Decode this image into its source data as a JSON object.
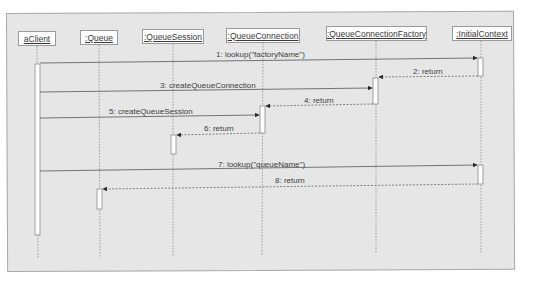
{
  "diagram": {
    "type": "UML sequence diagram",
    "lifelines": [
      {
        "id": "aClient",
        "label": "aClient",
        "x": 37
      },
      {
        "id": "queue",
        "label": ":Queue",
        "x": 99
      },
      {
        "id": "queueSession",
        "label": ":QueueSession",
        "x": 173
      },
      {
        "id": "queueConnection",
        "label": ":QueueConnection",
        "x": 263
      },
      {
        "id": "queueConnectionFactory",
        "label": ":QueueConnectionFactory",
        "x": 376
      },
      {
        "id": "initialContext",
        "label": ":InitialContext",
        "x": 481
      }
    ],
    "messages": [
      {
        "num": "1",
        "label": "1: lookup(\"factoryName\")",
        "from": "aClient",
        "to": "initialContext",
        "kind": "call"
      },
      {
        "num": "2",
        "label": "2: return",
        "from": "initialContext",
        "to": "queueConnectionFactory",
        "kind": "return"
      },
      {
        "num": "3",
        "label": "3: createQueueConnection",
        "from": "aClient",
        "to": "queueConnectionFactory",
        "kind": "call"
      },
      {
        "num": "4",
        "label": "4: return",
        "from": "queueConnectionFactory",
        "to": "queueConnection",
        "kind": "return"
      },
      {
        "num": "5",
        "label": "5: createQueueSession",
        "from": "aClient",
        "to": "queueConnection",
        "kind": "call"
      },
      {
        "num": "6",
        "label": "6: return",
        "from": "queueConnection",
        "to": "queueSession",
        "kind": "return"
      },
      {
        "num": "7",
        "label": "7: lookup(\"queueName\")",
        "from": "aClient",
        "to": "initialContext",
        "kind": "call"
      },
      {
        "num": "8",
        "label": "8: return",
        "from": "initialContext",
        "to": "queue",
        "kind": "return"
      }
    ]
  },
  "colors": {
    "frame_bg": "#e6e6e6",
    "frame_border": "#a9a9a9",
    "line": "#555555",
    "box_bg": "#fdfdfd"
  }
}
